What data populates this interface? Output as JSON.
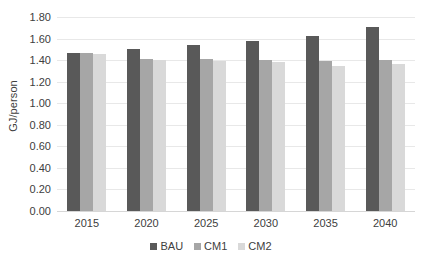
{
  "chart_data": {
    "type": "bar",
    "title": "",
    "subtitle": "",
    "xlabel": "",
    "ylabel": "GJ/person",
    "categories": [
      "2015",
      "2020",
      "2025",
      "2030",
      "2035",
      "2040"
    ],
    "series": [
      {
        "name": "BAU",
        "color": "#595959",
        "values": [
          1.47,
          1.5,
          1.54,
          1.58,
          1.62,
          1.71
        ]
      },
      {
        "name": "CM1",
        "color": "#a6a6a6",
        "values": [
          1.47,
          1.41,
          1.41,
          1.4,
          1.39,
          1.4
        ]
      },
      {
        "name": "CM2",
        "color": "#d9d9d9",
        "values": [
          1.46,
          1.4,
          1.39,
          1.38,
          1.35,
          1.36
        ]
      }
    ],
    "ylim": [
      0.0,
      1.8
    ],
    "ytick_step": 0.2,
    "ytick_labels": [
      "0.00",
      "0.20",
      "0.40",
      "0.60",
      "0.80",
      "1.00",
      "1.20",
      "1.40",
      "1.60",
      "1.80"
    ],
    "grid": true,
    "legend_position": "bottom",
    "gridline_color": "#e8e8e8",
    "axis_color": "#d6d6d6",
    "text_color": "#404040",
    "background_color": "#ffffff"
  }
}
